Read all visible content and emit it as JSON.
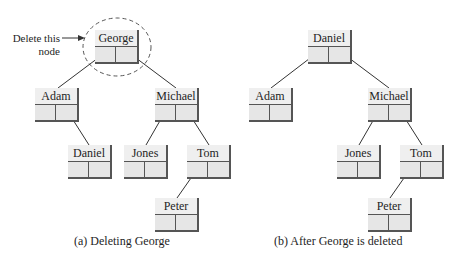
{
  "annotation": {
    "line1": "Delete this",
    "line2": "node"
  },
  "panels": [
    {
      "caption": "(a) Deleting George",
      "nodes": [
        {
          "id": "a-george",
          "label": "George",
          "x": 95,
          "y": 30
        },
        {
          "id": "a-adam",
          "label": "Adam",
          "x": 35,
          "y": 88
        },
        {
          "id": "a-michael",
          "label": "Michael",
          "x": 155,
          "y": 88
        },
        {
          "id": "a-daniel",
          "label": "Daniel",
          "x": 68,
          "y": 145
        },
        {
          "id": "a-jones",
          "label": "Jones",
          "x": 124,
          "y": 145
        },
        {
          "id": "a-tom",
          "label": "Tom",
          "x": 187,
          "y": 145
        },
        {
          "id": "a-peter",
          "label": "Peter",
          "x": 155,
          "y": 198
        }
      ],
      "edges": [
        [
          "George",
          "Adam"
        ],
        [
          "George",
          "Michael"
        ],
        [
          "Adam",
          "Daniel"
        ],
        [
          "Michael",
          "Jones"
        ],
        [
          "Michael",
          "Tom"
        ],
        [
          "Tom",
          "Peter"
        ]
      ]
    },
    {
      "caption": "(b) After George is deleted",
      "nodes": [
        {
          "id": "b-daniel",
          "label": "Daniel",
          "x": 308,
          "y": 30
        },
        {
          "id": "b-adam",
          "label": "Adam",
          "x": 249,
          "y": 88
        },
        {
          "id": "b-michael",
          "label": "Michael",
          "x": 368,
          "y": 88
        },
        {
          "id": "b-jones",
          "label": "Jones",
          "x": 337,
          "y": 145
        },
        {
          "id": "b-tom",
          "label": "Tom",
          "x": 400,
          "y": 145
        },
        {
          "id": "b-peter",
          "label": "Peter",
          "x": 368,
          "y": 198
        }
      ],
      "edges": [
        [
          "Daniel",
          "Adam"
        ],
        [
          "Daniel",
          "Michael"
        ],
        [
          "Michael",
          "Jones"
        ],
        [
          "Michael",
          "Tom"
        ],
        [
          "Tom",
          "Peter"
        ]
      ]
    }
  ],
  "colors": {
    "node_fill": "#ececec",
    "node_border": "#555555",
    "edge": "#333333",
    "dashed_circle": "#555555"
  }
}
